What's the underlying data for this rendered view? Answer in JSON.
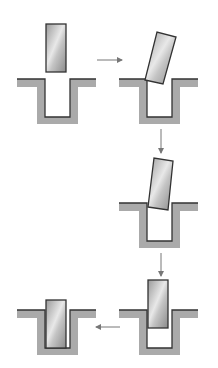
{
  "diagram": {
    "type": "process-sequence",
    "colors": {
      "ground_fill": "#aaaaaa",
      "outline": "#333333",
      "arrow": "#777777",
      "block_dark": "#8a8a8a",
      "block_light": "#e6e6e6"
    },
    "steps": [
      {
        "id": 1,
        "state": "block-above-channel",
        "panel_x": 17,
        "ground_y": 79
      },
      {
        "id": 2,
        "state": "block-tilted-at-edge",
        "panel_x": 119,
        "ground_y": 79
      },
      {
        "id": 3,
        "state": "block-entering-tilted",
        "panel_x": 119,
        "ground_y": 203
      },
      {
        "id": 4,
        "state": "block-partially-inserted",
        "panel_x": 119,
        "ground_y": 310
      },
      {
        "id": 5,
        "state": "block-fully-seated",
        "panel_x": 17,
        "ground_y": 310
      }
    ],
    "arrows": [
      {
        "from": 1,
        "to": 2,
        "direction": "right"
      },
      {
        "from": 2,
        "to": 3,
        "direction": "down"
      },
      {
        "from": 3,
        "to": 4,
        "direction": "down"
      },
      {
        "from": 4,
        "to": 5,
        "direction": "left"
      }
    ]
  }
}
